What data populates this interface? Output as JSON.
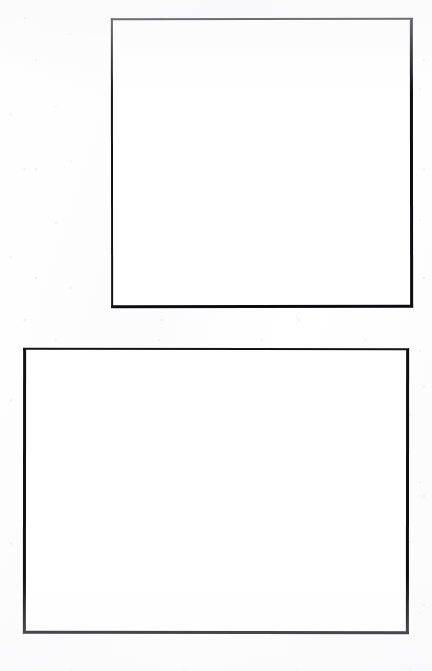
{
  "page": {
    "kind": "scanned-document-page",
    "width": 432,
    "height": 671,
    "background_color": "#fdfdfd",
    "paper_tone": "off-white",
    "text_content": "",
    "caption": "",
    "header": "",
    "footer": "",
    "page_number": ""
  },
  "ink": {
    "border_color": "#111114",
    "border_width_px": 2,
    "fill_color": "#ffffff"
  },
  "figures": [
    {
      "id": "figure-frame-1",
      "label": "",
      "caption": "",
      "content": "",
      "state": "empty",
      "shape": "rectangle",
      "orientation": "square",
      "x": 111,
      "y": 18,
      "width": 302,
      "height": 290
    },
    {
      "id": "figure-frame-2",
      "label": "",
      "caption": "",
      "content": "",
      "state": "empty",
      "shape": "rectangle",
      "orientation": "landscape",
      "x": 23,
      "y": 348,
      "width": 386,
      "height": 286
    }
  ]
}
